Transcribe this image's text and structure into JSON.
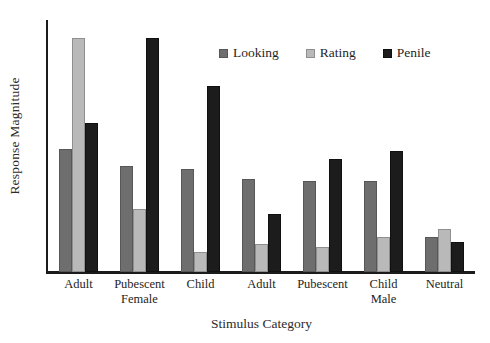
{
  "chart_data": {
    "type": "bar",
    "title": "",
    "xlabel": "Stimulus Category",
    "ylabel": "Response Magnitude",
    "ylim": [
      0,
      100
    ],
    "grid": false,
    "legend_position": "top-center",
    "categories": [
      "Adult",
      "Pubescent",
      "Child",
      "Adult",
      "Pubescent",
      "Child",
      "Neutral"
    ],
    "category_sublabels": [
      "",
      "Female",
      "",
      "",
      "",
      "Male",
      ""
    ],
    "series": [
      {
        "name": "Looking",
        "color": "#6e6e6e",
        "values": [
          49,
          42,
          41,
          37,
          36,
          36,
          14
        ]
      },
      {
        "name": "Rating",
        "color": "#b9b9b9",
        "values": [
          93,
          25,
          8,
          11,
          10,
          14,
          17
        ]
      },
      {
        "name": "Penile",
        "color": "#1c1c1c",
        "values": [
          59,
          93,
          74,
          23,
          45,
          48,
          12
        ]
      }
    ]
  },
  "axis": {
    "y_title": "Response Magnitude",
    "x_title": "Stimulus Category"
  },
  "legend": {
    "items": [
      {
        "label": "Looking",
        "swatch": "looking-swatch-icon"
      },
      {
        "label": "Rating",
        "swatch": "rating-swatch-icon"
      },
      {
        "label": "Penile",
        "swatch": "penile-swatch-icon"
      }
    ]
  },
  "ticks": [
    {
      "line1": "Adult",
      "line2": ""
    },
    {
      "line1": "Pubescent",
      "line2": "Female"
    },
    {
      "line1": "Child",
      "line2": ""
    },
    {
      "line1": "Adult",
      "line2": ""
    },
    {
      "line1": "Pubescent",
      "line2": ""
    },
    {
      "line1": "Child",
      "line2": "Male"
    },
    {
      "line1": "Neutral",
      "line2": ""
    }
  ]
}
